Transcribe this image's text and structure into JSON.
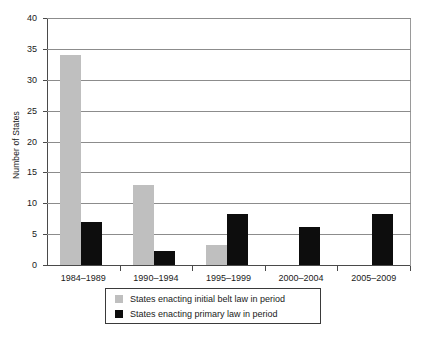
{
  "chart_data": {
    "type": "bar",
    "title": "",
    "subtitle": "",
    "xlabel": "",
    "ylabel": "Number of States",
    "categories": [
      "1984–1989",
      "1990–1994",
      "1995–1999",
      "2000–2004",
      "2005–2009"
    ],
    "series": [
      {
        "name": "States enacting initial belt law in period",
        "color": "#bfbfbf",
        "values": [
          34,
          13,
          3.3,
          0,
          0
        ]
      },
      {
        "name": "States enacting primary law in period",
        "color": "#0d0d0d",
        "values": [
          7,
          2.2,
          8.2,
          6.2,
          8.3
        ]
      }
    ],
    "ylim": [
      0,
      40
    ],
    "ytick_values": [
      0,
      5,
      10,
      15,
      20,
      25,
      30,
      35,
      40
    ],
    "ytick_labels": [
      "0",
      "5",
      "10",
      "15",
      "20",
      "25",
      "30",
      "35",
      "40"
    ],
    "grid": {
      "horizontal": true,
      "vertical": false,
      "color": "#8c8c8c"
    },
    "legend": {
      "position": "bottom",
      "border": true,
      "entries": [
        {
          "label": "States enacting initial belt law in period",
          "color": "#bfbfbf"
        },
        {
          "label": "States enacting primary law in period",
          "color": "#0d0d0d"
        }
      ]
    },
    "axis_color": "#4a4a4a",
    "background": "#ffffff"
  }
}
